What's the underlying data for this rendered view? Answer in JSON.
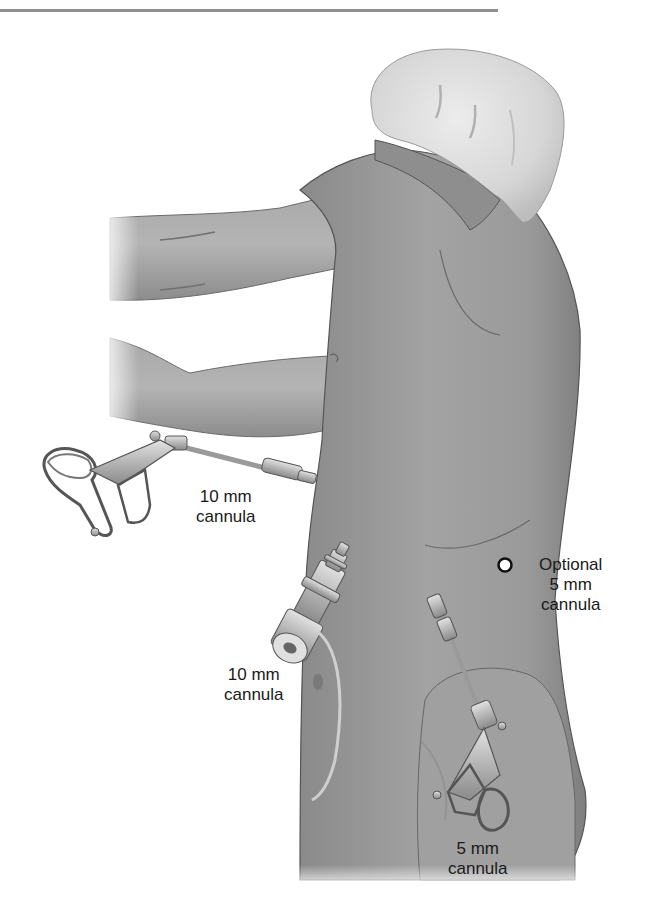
{
  "figure": {
    "colors": {
      "skin": "#9a9a9a",
      "skin_dark": "#7c7c7c",
      "skin_light": "#b8b8b8",
      "cap": "#dcdcdc",
      "instrument": "#c4c4c4",
      "outline": "#4a4a4a",
      "rule": "#8f8f8f"
    }
  },
  "labels": {
    "upper_cannula": {
      "line1": "10 mm",
      "line2": "cannula"
    },
    "camera_cannula": {
      "line1": "10 mm",
      "line2": "cannula"
    },
    "optional_cannula": {
      "line1": "Optional",
      "line2": "5 mm",
      "line3": "cannula"
    },
    "lower_cannula": {
      "line1": "5 mm",
      "line2": "cannula"
    }
  },
  "markers": {
    "optional_port": {
      "symbol": "open-circle"
    }
  }
}
